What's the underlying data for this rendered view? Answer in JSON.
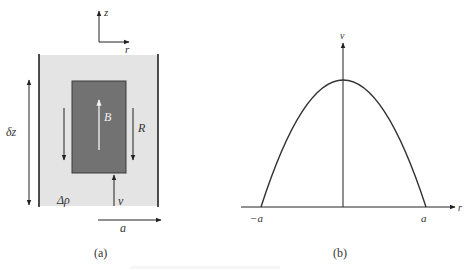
{
  "figure": {
    "panel_a": {
      "caption": "(a)",
      "axis_labels": {
        "vertical": "z",
        "horizontal": "r"
      },
      "labels": {
        "height_increment": "δz",
        "bubble": "B",
        "drainage": "R",
        "density_difference": "Δρ",
        "velocity": "v",
        "radius": "a"
      },
      "colors": {
        "fluid": "#e4e4e4",
        "bubble": "#727272",
        "wall": "#222222",
        "bubble_arrow": "#eeeeee"
      }
    },
    "panel_b": {
      "caption": "(b)",
      "axis_labels": {
        "vertical": "v",
        "horizontal": "r"
      },
      "tick_labels": {
        "left": "−a",
        "right": "a"
      },
      "curve": "parabolic velocity profile"
    },
    "bottom_caption": ""
  }
}
